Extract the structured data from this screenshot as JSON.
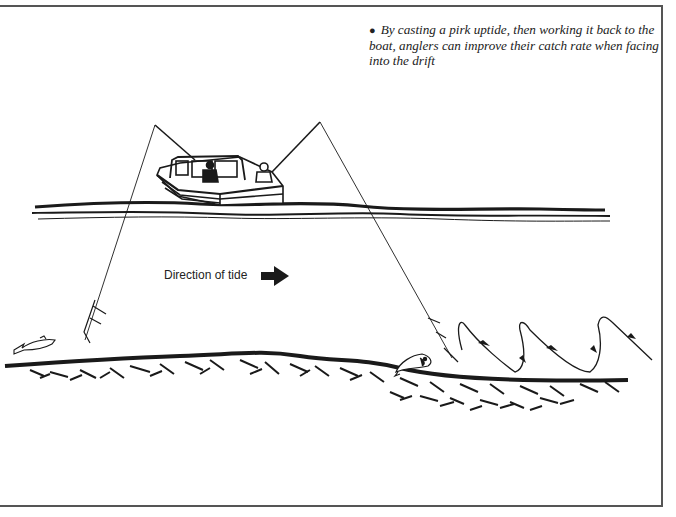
{
  "diagram": {
    "caption": {
      "bullet": "●",
      "text": "By casting a pirk uptide, then working it back to the boat, anglers can improve their catch rate when facing into the drift"
    },
    "tide_label": "Direction of tide",
    "icons": {
      "tide_arrow": "arrow-right-icon",
      "boat": "boat-icon",
      "fish_left": "fish-icon",
      "fish_right": "fish-icon"
    },
    "colors": {
      "ink": "#1a1a1a",
      "frame": "#555555",
      "background": "#ffffff"
    }
  }
}
